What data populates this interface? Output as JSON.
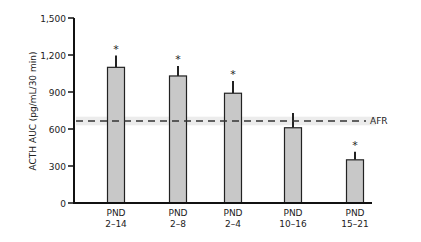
{
  "chart_data": {
    "type": "bar",
    "title": "",
    "xlabel": "",
    "ylabel": "ACTH AUC (pg/mL/30 min)",
    "ylim": [
      0,
      1500
    ],
    "yticks": [
      0,
      300,
      600,
      900,
      1200,
      1500
    ],
    "ytick_labels": [
      "0",
      "300",
      "600",
      "900",
      "1,200",
      "1,500"
    ],
    "categories": [
      "PND 2–14",
      "PND 2–8",
      "PND 2–4",
      "PND 10–16",
      "PND 15–21"
    ],
    "category_lines": [
      [
        "PND",
        "2–14"
      ],
      [
        "PND",
        "2–8"
      ],
      [
        "PND",
        "2–4"
      ],
      [
        "PND",
        "10–16"
      ],
      [
        "PND",
        "15–21"
      ]
    ],
    "values": [
      1100,
      1030,
      890,
      610,
      350
    ],
    "error_upper": [
      1195,
      1110,
      990,
      730,
      415
    ],
    "significant": [
      true,
      true,
      true,
      false,
      true
    ],
    "significance_marker": "*",
    "reference_line": {
      "label": "AFR",
      "value": 665,
      "band": [
        630,
        700
      ],
      "style": "dashed"
    },
    "grid": false,
    "legend": null,
    "bar_color": "#c8c8c8",
    "bar_edge_color": "#222222"
  }
}
